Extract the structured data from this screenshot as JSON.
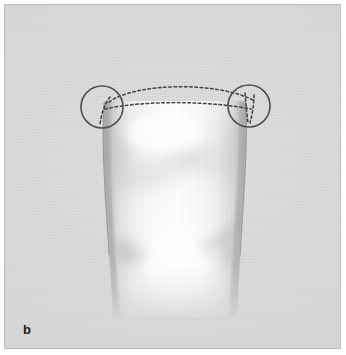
{
  "figure": {
    "panel_label": "b",
    "caption_text": "",
    "type": "anatomical-illustration",
    "background_color": "#d7d8d9",
    "frame_border_color": "#b9bcbd",
    "structure_fill_color": "#ffffff",
    "structure_shadow_color": "#b0b2b4",
    "annotation_color": "#4a4c50",
    "label_color": "#1d1e20"
  },
  "annotations": {
    "circles": [
      {
        "name": "left-region-of-interest",
        "cx": 97,
        "cy": 102,
        "r": 21,
        "stroke": "#4d4f53",
        "stroke_width": 1.6,
        "fill": "none"
      },
      {
        "name": "right-region-of-interest",
        "cx": 244,
        "cy": 101,
        "r": 21,
        "stroke": "#4d4f53",
        "stroke_width": 1.6,
        "fill": "none"
      }
    ],
    "dashed_curves": [
      {
        "name": "upper-dashed-arc",
        "description": "upper convex dashed arc spanning between the two circled regions",
        "dash": "2.6 2.6",
        "stroke": "#3f4145",
        "stroke_width": 1.5
      },
      {
        "name": "lower-dashed-arc",
        "description": "lower flatter dashed arc spanning between the two circled regions",
        "dash": "2.6 2.6",
        "stroke": "#3f4145",
        "stroke_width": 1.5
      },
      {
        "name": "left-dashed-descender",
        "description": "short dashed line descending inside the left circle",
        "dash": "2.6 2.6",
        "stroke": "#3f4145",
        "stroke_width": 1.5
      },
      {
        "name": "right-dashed-descender-outer",
        "description": "short dashed line descending inside the right circle",
        "dash": "2.6 2.6",
        "stroke": "#3f4145",
        "stroke_width": 1.5
      },
      {
        "name": "right-dashed-descender-inner",
        "description": "second short dashed line descending inside the right circle",
        "dash": "2.6 2.6",
        "stroke": "#3f4145",
        "stroke_width": 1.5
      }
    ]
  },
  "geometry": {
    "canvas_width": 337,
    "canvas_height": 345,
    "structure_top_y": 96,
    "structure_bottom_y": 310,
    "structure_left_x_top": 99,
    "structure_right_x_top": 241,
    "structure_left_x_bottom": 105,
    "structure_right_x_bottom": 234
  }
}
